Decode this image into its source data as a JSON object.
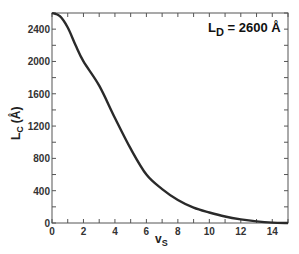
{
  "chart_data": {
    "type": "line",
    "title": "",
    "xlabel": "v",
    "xlabel_sub": "S",
    "ylabel": "L",
    "ylabel_sub": "C",
    "ylabel_unit": "(Å)",
    "xlim": [
      0,
      15
    ],
    "ylim": [
      0,
      2600
    ],
    "x_ticks": [
      0,
      2,
      4,
      6,
      8,
      10,
      12,
      14
    ],
    "x_tick_labels": [
      "0",
      "2",
      "4",
      "6",
      "8",
      "10",
      "12",
      "14"
    ],
    "y_ticks": [
      0,
      400,
      800,
      1200,
      1600,
      2000,
      2400
    ],
    "y_tick_labels": [
      "0",
      "400",
      "800",
      "1200",
      "1600",
      "2000",
      "2400"
    ],
    "grid": false,
    "annotation": {
      "main": "L",
      "sub": "D",
      "rest": " = 2600 Å"
    },
    "series": [
      {
        "name": "L_C",
        "x": [
          0,
          0.5,
          1,
          1.5,
          2,
          3,
          4,
          5,
          6,
          7,
          8,
          9,
          10,
          11,
          12,
          13,
          14,
          15
        ],
        "values": [
          2600,
          2560,
          2420,
          2200,
          2000,
          1700,
          1300,
          920,
          600,
          420,
          285,
          190,
          130,
          80,
          45,
          20,
          5,
          0
        ]
      }
    ]
  }
}
